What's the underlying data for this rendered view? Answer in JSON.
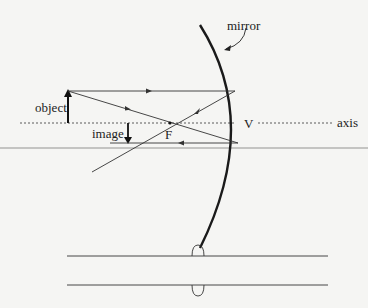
{
  "diagram": {
    "type": "concave-mirror-ray-diagram",
    "labels": {
      "mirror": "mirror",
      "object": "object",
      "image": "image",
      "focal_point": "F",
      "vertex": "V",
      "axis": "axis"
    },
    "colors": {
      "background": "#f5f5f3",
      "line": "#2a2a2a",
      "separator": "#bdbdbd"
    },
    "elements": [
      "concave mirror arc",
      "principal axis (dashed)",
      "object arrow (upright)",
      "image arrow (inverted)",
      "ray parallel to axis reflecting through F",
      "ray through F reflecting parallel to axis",
      "two parallel lines with small loops (lower figure)"
    ]
  }
}
